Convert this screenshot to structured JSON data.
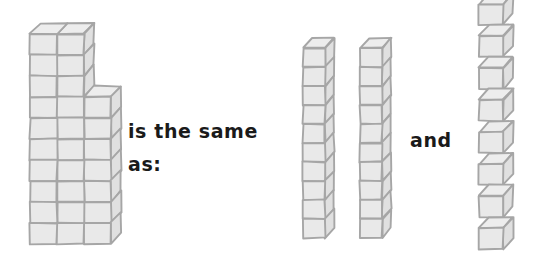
{
  "page": {
    "background_color": "#ffffff",
    "width": 543,
    "height": 260
  },
  "labels": {
    "same_line1": "is the same",
    "same_line2": "as:",
    "and": "and",
    "full_sentence": "is the same as: and"
  },
  "colors": {
    "cube_face_top": "#ededed",
    "cube_face_front": "#e9e9e9",
    "cube_face_side": "#e0e0e0",
    "cube_outline": "#a6a6a6",
    "text": "#1a1a1a",
    "background": "#ffffff"
  },
  "chart_data": {
    "type": "table",
    "xlabel": "",
    "ylabel": "",
    "categories": [
      "stepped-block-structure",
      "tower-1",
      "tower-2",
      "loose-cubes"
    ],
    "values": [
      28,
      10,
      10,
      8
    ],
    "annotations": [
      "is the same",
      "as:",
      "and"
    ]
  },
  "groups": {
    "stepped_block": {
      "name": "stepped-block-structure",
      "total_cubes": 28,
      "description": "Isometric stacked cube structure, 2 columns wide for the top 3 rows and 3 columns wide for the lower 7 rows",
      "rows": 10,
      "top_section_rows": 3,
      "top_section_columns": 2,
      "bottom_section_rows": 7,
      "bottom_section_columns": 3,
      "origin_x": 30,
      "origin_y": 34,
      "cell_w": 27,
      "cell_h": 21,
      "depth_x": 10,
      "depth_y": -11
    },
    "tower_1": {
      "name": "cube-tower-1",
      "cubes": 10,
      "origin_x": 303,
      "origin_y": 48,
      "cell_w": 22,
      "cell_h": 19,
      "depth_x": 9,
      "depth_y": -10
    },
    "tower_2": {
      "name": "cube-tower-2",
      "cubes": 10,
      "origin_x": 360,
      "origin_y": 48,
      "cell_w": 22,
      "cell_h": 19,
      "depth_x": 9,
      "depth_y": -10
    },
    "loose_cubes": {
      "name": "loose-single-cubes",
      "cubes": 8,
      "origin_x": 479,
      "origin_y": 4,
      "cell_w": 24,
      "cell_h": 21,
      "depth_x": 10,
      "depth_y": -11,
      "gap_y": 32
    }
  }
}
